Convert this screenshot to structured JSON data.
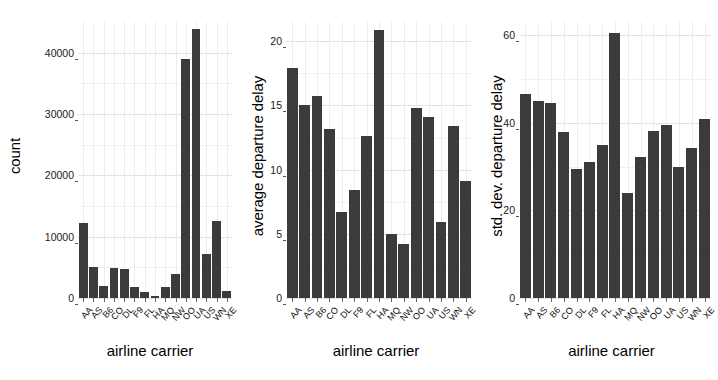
{
  "figure": {
    "background": "#ffffff",
    "bar_color": "#3b3b3b",
    "grid_color": "#e2e2e2",
    "panel_count": 3
  },
  "chart_data": [
    {
      "type": "bar",
      "title": "",
      "xlabel": "airline carrier",
      "ylabel": "count",
      "categories": [
        "AA",
        "AS",
        "B6",
        "CO",
        "DL",
        "F9",
        "FL",
        "HA",
        "MQ",
        "NW",
        "OO",
        "UA",
        "US",
        "WN",
        "XE"
      ],
      "values": [
        12200,
        5100,
        2000,
        4900,
        4700,
        1800,
        1000,
        300,
        1800,
        3900,
        39000,
        43800,
        7200,
        12600,
        1200
      ],
      "ylim": [
        0,
        45000
      ],
      "yticks": [
        0,
        10000,
        20000,
        30000,
        40000
      ],
      "ytick_labels": [
        "0",
        "10000",
        "20000",
        "30000",
        "40000"
      ],
      "grid": true,
      "legend": "none"
    },
    {
      "type": "bar",
      "title": "",
      "xlabel": "airline carrier",
      "ylabel": "average departure delay",
      "categories": [
        "AA",
        "AS",
        "B6",
        "CO",
        "DL",
        "F9",
        "FL",
        "HA",
        "MQ",
        "NW",
        "OO",
        "UA",
        "US",
        "WN",
        "XE"
      ],
      "values": [
        17.9,
        15.0,
        15.7,
        13.2,
        6.7,
        8.4,
        12.6,
        20.9,
        5.0,
        4.2,
        14.8,
        14.1,
        5.9,
        13.4,
        9.1
      ],
      "ylim": [
        0,
        21.5
      ],
      "yticks": [
        0,
        5,
        10,
        15,
        20
      ],
      "ytick_labels": [
        "0",
        "5",
        "10",
        "15",
        "20"
      ],
      "grid": true,
      "legend": "none"
    },
    {
      "type": "bar",
      "title": "",
      "xlabel": "airline carrier",
      "ylabel": "std. dev. departure delay",
      "categories": [
        "AA",
        "AS",
        "B6",
        "CO",
        "DL",
        "F9",
        "FL",
        "HA",
        "MQ",
        "NW",
        "OO",
        "UA",
        "US",
        "WN",
        "XE"
      ],
      "values": [
        46.5,
        45.0,
        44.6,
        38.0,
        29.5,
        31.0,
        35.0,
        60.5,
        24.0,
        32.2,
        38.2,
        39.5,
        30.0,
        34.2,
        40.8
      ],
      "ylim": [
        0,
        63
      ],
      "yticks": [
        0,
        20,
        40,
        60
      ],
      "ytick_labels": [
        "0",
        "20",
        "40",
        "60"
      ],
      "grid": true,
      "legend": "none"
    }
  ]
}
